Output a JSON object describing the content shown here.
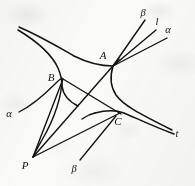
{
  "figure": {
    "kind": "geometry-diagram",
    "background_color": "#fbfbfa",
    "ink_color": "#14120f",
    "width": 195,
    "height": 186,
    "labels": [
      {
        "id": "A",
        "text": "A",
        "kind": "point",
        "x": 103,
        "y": 59,
        "style": "italic"
      },
      {
        "id": "B",
        "text": "B",
        "kind": "point",
        "x": 51,
        "y": 81,
        "style": "italic"
      },
      {
        "id": "C",
        "text": "C",
        "kind": "point",
        "x": 118,
        "y": 125,
        "style": "italic"
      },
      {
        "id": "P",
        "text": "P",
        "kind": "point",
        "x": 25,
        "y": 169,
        "style": "italic"
      },
      {
        "id": "beta-top",
        "text": "β",
        "kind": "greek",
        "x": 143,
        "y": 16,
        "style": "italic"
      },
      {
        "id": "l-top",
        "text": "l",
        "kind": "line-name",
        "x": 157,
        "y": 25,
        "style": "italic"
      },
      {
        "id": "alpha-top",
        "text": "α",
        "kind": "greek",
        "x": 168,
        "y": 33,
        "style": "italic"
      },
      {
        "id": "alpha-left",
        "text": "α",
        "kind": "greek",
        "x": 9,
        "y": 117,
        "style": "italic"
      },
      {
        "id": "beta-bottom",
        "text": "β",
        "kind": "greek",
        "x": 74,
        "y": 172,
        "style": "italic"
      },
      {
        "id": "t-right",
        "text": "t",
        "kind": "line-name",
        "x": 177,
        "y": 137,
        "style": "italic"
      }
    ],
    "nodes": [
      {
        "id": "A",
        "x": 113,
        "y": 66
      },
      {
        "id": "B",
        "x": 62,
        "y": 78
      },
      {
        "id": "C",
        "x": 121,
        "y": 114
      },
      {
        "id": "P",
        "x": 33,
        "y": 157
      }
    ],
    "strokes": [
      {
        "id": "conic-upper-branch",
        "type": "curve",
        "width": 1.5
      },
      {
        "id": "conic-lower-branch",
        "type": "curve",
        "width": 1.5
      },
      {
        "id": "conic-left-arc",
        "type": "curve",
        "width": 1.5
      },
      {
        "id": "conic-right-arc",
        "type": "curve",
        "width": 1.5
      },
      {
        "id": "tangent-alpha-curve",
        "type": "curve",
        "width": 1.3
      },
      {
        "id": "ray-beta-from-A",
        "type": "line",
        "width": 1.4
      },
      {
        "id": "ray-l-from-A",
        "type": "line",
        "width": 1.4
      },
      {
        "id": "ray-alpha-from-A",
        "type": "line",
        "width": 1.4
      },
      {
        "id": "segment-P-to-A",
        "type": "line",
        "width": 1.4
      },
      {
        "id": "segment-P-to-B",
        "type": "line",
        "width": 1.4
      },
      {
        "id": "segment-P-to-C",
        "type": "line",
        "width": 1.4
      },
      {
        "id": "segment-B-to-C",
        "type": "line",
        "width": 1.4
      },
      {
        "id": "ray-beta-to-C",
        "type": "line",
        "width": 1.3
      }
    ]
  }
}
